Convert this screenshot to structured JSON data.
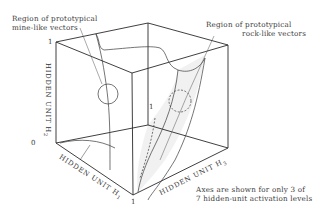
{
  "diagram": {
    "type": "3d-cube-hidden-unit-space",
    "annotations": {
      "mine_label_line1": "Region of prototypical",
      "mine_label_line2": "mine-like vectors",
      "rock_label_line1": "Region of prototypical",
      "rock_label_line2": "rock-like vectors"
    },
    "axes": {
      "h1": "HIDDEN UNIT H",
      "h1_sub": "1",
      "h2": "HIDDEN UNIT H",
      "h2_sub": "2",
      "h3": "HIDDEN UNIT H",
      "h3_sub": "3"
    },
    "ticks": {
      "origin": "0",
      "h2_max": "1",
      "h1_max": "1",
      "h3_max": "1"
    },
    "note_line1": "Axes are shown for only 3 of",
    "note_line2": "7 hidden-unit activation levels"
  }
}
